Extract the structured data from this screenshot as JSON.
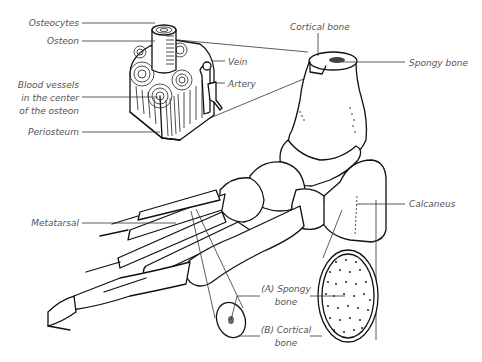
{
  "figure": {
    "ink_color": "#111111",
    "label_color": "#555555",
    "background": "#ffffff"
  },
  "labels": {
    "osteocytes": "Osteocytes",
    "osteon": "Osteon",
    "vein": "Vein",
    "artery": "Artery",
    "blood_vessels_1": "Blood vessels",
    "blood_vessels_2": "in the center",
    "blood_vessels_3": "of the osteon",
    "periosteum": "Periosteum",
    "cortical_bone_top": "Cortical bone",
    "spongy_bone_top": "Spongy bone",
    "calcaneus": "Calcaneus",
    "metatarsal": "Metatarsal",
    "spongy_a_1": "(A) Spongy",
    "spongy_a_2": "bone",
    "cortical_b_1": "(B) Cortical",
    "cortical_b_2": "bone"
  }
}
